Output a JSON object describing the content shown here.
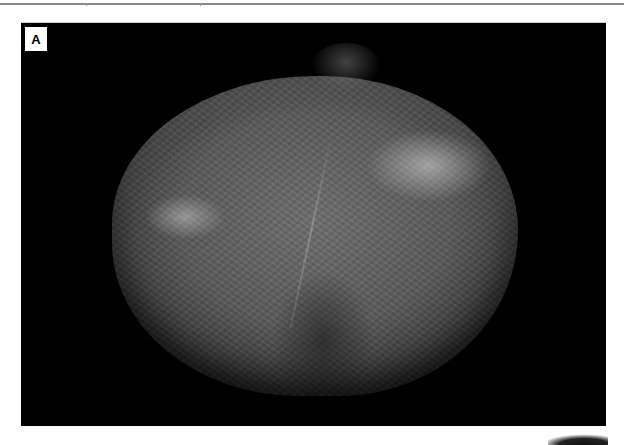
{
  "page": {
    "header_rule": {
      "color": "#8a8a8a",
      "tick_marks": 2
    }
  },
  "figure": {
    "panel_label": "A",
    "panel_background": "#000000",
    "image_description": "grayscale microscopy image of a roughly spherical specimen with textured surface on black background",
    "colors": {
      "specimen_mid": "#5a5a5a",
      "highlight": "#dcdcdc"
    }
  },
  "next_figure_fragment": {
    "visible": true
  }
}
